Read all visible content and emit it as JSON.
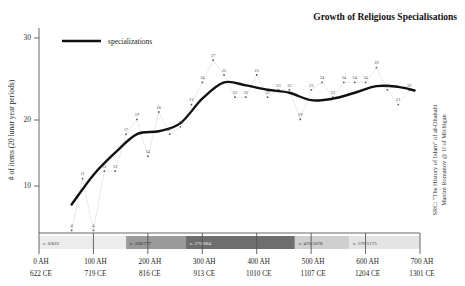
{
  "header": {
    "title": "Growth of Religious Specialisations"
  },
  "legend": {
    "position": "top-left",
    "entries": [
      {
        "label": "specializations",
        "color": "#111111",
        "marker": "line"
      }
    ]
  },
  "source_note": {
    "line1": "SRC: \"The History of Islam\" of al-Dhahabi",
    "line2": "Maxim Romanov @ U of Michigan"
  },
  "axes": {
    "y": {
      "label": "# of items (20 lunar year periods)",
      "ticks": [
        "10",
        "20",
        "30"
      ],
      "tick_values": [
        10,
        20,
        30
      ],
      "min": 0,
      "max": 32
    },
    "x": {
      "label": "",
      "tick_labels_ah": [
        "0 AH",
        "100 AH",
        "200 AH",
        "300 AH",
        "400 AH",
        "500 AH",
        "600 AH",
        "700 AH"
      ],
      "tick_labels_ce": [
        "622 CE",
        "719 CE",
        "816 CE",
        "913 CE",
        "1010 CE",
        "1107 CE",
        "1204 CE",
        "1301 CE"
      ],
      "tick_values": [
        0,
        100,
        200,
        300,
        400,
        500,
        600,
        700
      ],
      "min": 0,
      "max": 700
    }
  },
  "era_bands": [
    {
      "label": "c. 0/622",
      "start": 0,
      "end": 160,
      "color": "#ececec",
      "text_color": "#333333"
    },
    {
      "label": "c. 160/777",
      "start": 160,
      "end": 270,
      "color": "#9a9a9a",
      "text_color": "#222222"
    },
    {
      "label": "c. 270/884",
      "start": 270,
      "end": 470,
      "color": "#6e6e6e",
      "text_color": "#f0f0f0"
    },
    {
      "label": "c. 470/1078",
      "start": 470,
      "end": 570,
      "color": "#cfcfcf",
      "text_color": "#333333"
    },
    {
      "label": "c. 570/1175",
      "start": 570,
      "end": 700,
      "color": "#e4e4e4",
      "text_color": "#333333"
    }
  ],
  "chart_data": {
    "type": "line",
    "title": "Growth of Religious Specialisations",
    "xlabel": "",
    "ylabel": "# of items (20 lunar year periods)",
    "xlim": [
      0,
      700
    ],
    "ylim": [
      0,
      32
    ],
    "grid": false,
    "legend_position": "top-left",
    "x_tick_labels": [
      "0 AH / 622 CE",
      "100 AH / 719 CE",
      "200 AH / 816 CE",
      "300 AH / 913 CE",
      "400 AH / 1010 CE",
      "500 AH / 1107 CE",
      "600 AH / 1204 CE",
      "700 AH / 1301 CE"
    ],
    "series": [
      {
        "name": "raw counts",
        "style": "dotted-with-markers",
        "color": "#b9b9b9",
        "x": [
          60,
          80,
          100,
          120,
          140,
          160,
          180,
          200,
          220,
          240,
          260,
          280,
          300,
          320,
          340,
          360,
          380,
          400,
          420,
          440,
          460,
          480,
          500,
          520,
          540,
          560,
          580,
          600,
          620,
          640,
          660,
          680
        ],
        "values": [
          4,
          11,
          4,
          12,
          12,
          17,
          19,
          14,
          20,
          17,
          18,
          21,
          24,
          27,
          25,
          22,
          22,
          25,
          22,
          23,
          23,
          19,
          23,
          24,
          22,
          24,
          24,
          24,
          26,
          23,
          21,
          23
        ]
      },
      {
        "name": "specializations",
        "style": "smoothed-trend",
        "color": "#111111",
        "x": [
          60,
          100,
          140,
          180,
          220,
          260,
          300,
          340,
          380,
          420,
          460,
          500,
          540,
          580,
          620,
          660,
          690
        ],
        "values": [
          7.5,
          11.5,
          14.5,
          17.0,
          17.4,
          18.5,
          21.8,
          24.0,
          23.6,
          23.0,
          22.6,
          21.6,
          21.8,
          22.6,
          23.5,
          23.4,
          22.9
        ]
      }
    ],
    "point_labels": [
      "4",
      "11",
      "4",
      "12",
      "12",
      "17",
      "19",
      "14",
      "20",
      "17",
      "18",
      "21",
      "24",
      "27",
      "25",
      "22",
      "22",
      "25",
      "22",
      "23",
      "23",
      "19",
      "23",
      "24",
      "22",
      "24",
      "24",
      "24",
      "26",
      "23",
      "21",
      "23"
    ]
  }
}
